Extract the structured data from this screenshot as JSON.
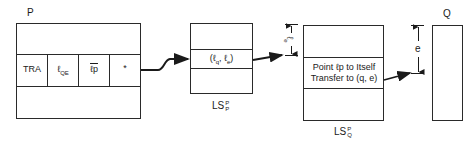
{
  "diagram": {
    "type": "memory-linkage-diagram",
    "nodes": {
      "p": {
        "label": "P",
        "fields": [
          {
            "text": "TRA"
          },
          {
            "text": "ℓ",
            "sub": "QE"
          },
          {
            "text": "ℓp",
            "overline": true
          },
          {
            "text": "*"
          }
        ]
      },
      "ls_p": {
        "label_base": "LS",
        "label_sub": "P",
        "label_sup": "P",
        "field": {
          "text": "(ℓ",
          "sub1": "q",
          "mid": ", ℓ",
          "sub2": "e",
          "end": ")"
        }
      },
      "ls_q": {
        "label_base": "LS",
        "label_sub": "Q",
        "label_sup": "P",
        "offset_label": "ℓ",
        "offset_sub": "e",
        "field_line1": "Point ℓp to Itself",
        "field_line2": "Transfer to (q, e)"
      },
      "q": {
        "label": "Q",
        "offset_label": "e"
      }
    },
    "edges": [
      {
        "from": "p.*",
        "to": "ls_p",
        "style": "wavy-arrow"
      },
      {
        "from": "ls_p",
        "to": "ls_q",
        "style": "arrow"
      },
      {
        "from": "ls_q",
        "to": "q",
        "style": "arrow"
      }
    ],
    "colors": {
      "stroke": "#2a2a2a",
      "background": "#ffffff"
    }
  }
}
